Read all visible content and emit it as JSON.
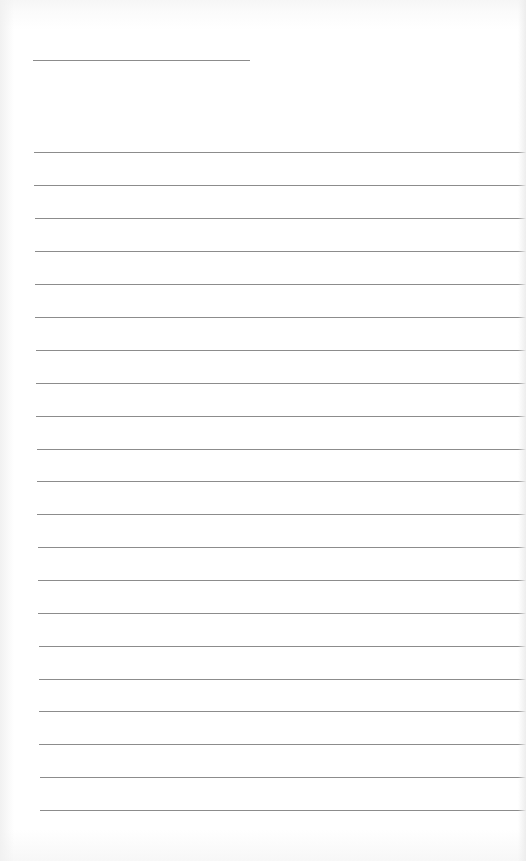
{
  "document": {
    "type": "lined-writing-paper",
    "background_color": "#ffffff",
    "line_color": "#8c8c8c",
    "title_line": {
      "x": 33,
      "y": 60,
      "width": 217
    },
    "ruled_lines": [
      {
        "x": 34,
        "y": 152
      },
      {
        "x": 34,
        "y": 185
      },
      {
        "x": 35,
        "y": 218
      },
      {
        "x": 35,
        "y": 251
      },
      {
        "x": 35,
        "y": 284
      },
      {
        "x": 35,
        "y": 317
      },
      {
        "x": 36,
        "y": 350
      },
      {
        "x": 36,
        "y": 383
      },
      {
        "x": 36,
        "y": 416
      },
      {
        "x": 37,
        "y": 449
      },
      {
        "x": 37,
        "y": 481
      },
      {
        "x": 37,
        "y": 514
      },
      {
        "x": 38,
        "y": 547
      },
      {
        "x": 38,
        "y": 580
      },
      {
        "x": 38,
        "y": 613
      },
      {
        "x": 39,
        "y": 646
      },
      {
        "x": 39,
        "y": 679
      },
      {
        "x": 39,
        "y": 711
      },
      {
        "x": 39,
        "y": 744
      },
      {
        "x": 40,
        "y": 777
      },
      {
        "x": 40,
        "y": 810
      }
    ]
  }
}
